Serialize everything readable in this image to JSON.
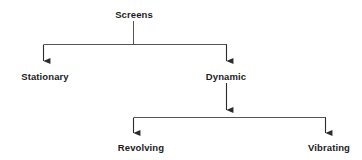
{
  "diagram": {
    "type": "tree-diagram",
    "orientation": "top-down",
    "colors": {
      "background": "#ffffff",
      "line": "#555555",
      "arrow": "#2b2b2b",
      "text": "#1c1c1c"
    },
    "nodes": {
      "root": {
        "label": "Screens",
        "level": 0
      },
      "stationary": {
        "label": "Stationary",
        "level": 1
      },
      "dynamic": {
        "label": "Dynamic",
        "level": 1
      },
      "revolving": {
        "label": "Revolving",
        "level": 2
      },
      "vibrating": {
        "label": "Vibrating",
        "level": 2
      }
    },
    "edges": [
      {
        "from": "Screens",
        "to": "Stationary"
      },
      {
        "from": "Screens",
        "to": "Dynamic"
      },
      {
        "from": "Dynamic",
        "to": "Revolving"
      },
      {
        "from": "Dynamic",
        "to": "Vibrating"
      }
    ]
  }
}
